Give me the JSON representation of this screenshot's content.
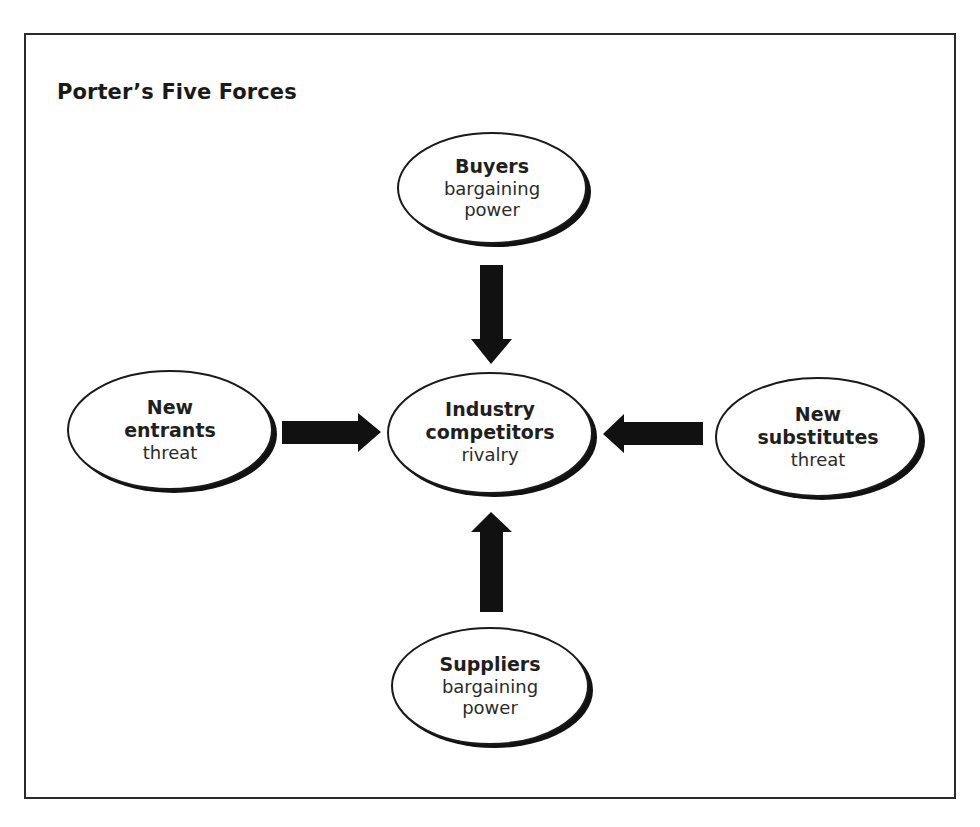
{
  "title": "Porter’s Five Forces",
  "nodes": {
    "buyers": {
      "lines_bold": [
        "Buyers"
      ],
      "lines_regular": [
        "bargaining",
        "power"
      ]
    },
    "new_entrants": {
      "lines_bold": [
        "New",
        "entrants"
      ],
      "lines_regular": [
        "threat"
      ]
    },
    "industry": {
      "lines_bold": [
        "Industry",
        "competitors"
      ],
      "lines_regular": [
        "rivalry"
      ]
    },
    "substitutes": {
      "lines_bold": [
        "New",
        "substitutes"
      ],
      "lines_regular": [
        "threat"
      ]
    },
    "suppliers": {
      "lines_bold": [
        "Suppliers"
      ],
      "lines_regular": [
        "bargaining",
        "power"
      ]
    }
  },
  "edges": [
    {
      "from": "buyers",
      "to": "industry",
      "direction": "down"
    },
    {
      "from": "new_entrants",
      "to": "industry",
      "direction": "right"
    },
    {
      "from": "substitutes",
      "to": "industry",
      "direction": "left"
    },
    {
      "from": "suppliers",
      "to": "industry",
      "direction": "up"
    }
  ],
  "colors": {
    "stroke": "#1a1a1a",
    "arrow_fill": "#111111",
    "background": "#ffffff"
  }
}
